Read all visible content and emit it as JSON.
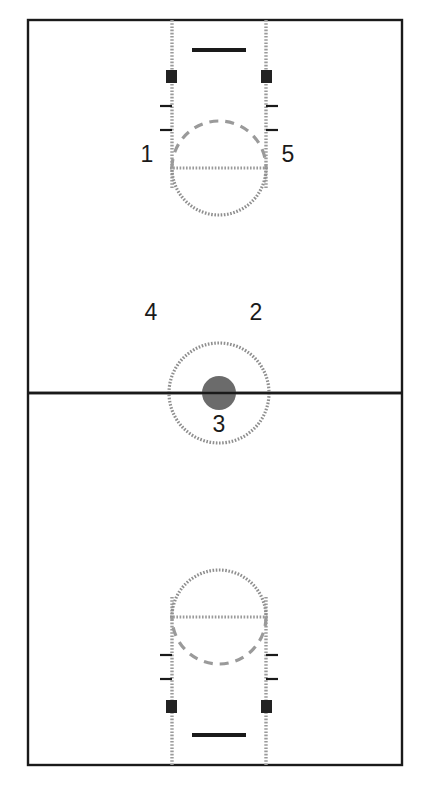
{
  "diagram": {
    "type": "basketball-court",
    "orientation": "vertical-full-court",
    "background_color": "#ffffff",
    "line_color_solid": "#1a1a1a",
    "line_color_dotted": "#9a9a9a",
    "marker_color": "#222222"
  },
  "court": {
    "boundary": {
      "x": 28,
      "y": 20,
      "width": 374,
      "height": 745
    },
    "half_court_line_y": 393,
    "center_circle": {
      "cx": 219,
      "cy": 393,
      "r": 50
    },
    "center_dot": {
      "cx": 219,
      "cy": 393,
      "r": 17
    }
  },
  "position_labels": [
    {
      "id": "1",
      "text": "1",
      "x": 147,
      "y": 162
    },
    {
      "id": "5",
      "text": "5",
      "x": 288,
      "y": 162
    },
    {
      "id": "4",
      "text": "4",
      "x": 151,
      "y": 320
    },
    {
      "id": "2",
      "text": "2",
      "x": 256,
      "y": 320
    },
    {
      "id": "3",
      "text": "3",
      "x": 219,
      "y": 432
    }
  ],
  "top_basket": {
    "lane": {
      "x": 172,
      "y": 20,
      "width": 94,
      "height": 168
    },
    "free_throw_line_y": 168,
    "free_throw_circle": {
      "cx": 219,
      "cy": 168,
      "r": 47
    },
    "backboard": {
      "x1": 192,
      "x2": 246,
      "y": 50
    },
    "lane_blocks": [
      {
        "x": 166,
        "y": 70,
        "width": 11,
        "height": 13
      },
      {
        "x": 261,
        "y": 70,
        "width": 11,
        "height": 13
      }
    ],
    "lane_ticks_y": [
      106,
      130
    ],
    "tick_length": 12
  },
  "bottom_basket": {
    "lane": {
      "x": 172,
      "y": 597,
      "width": 94,
      "height": 168
    },
    "free_throw_line_y": 617,
    "free_throw_circle": {
      "cx": 219,
      "cy": 617,
      "r": 47
    },
    "backboard": {
      "x1": 192,
      "x2": 246,
      "y": 735
    },
    "lane_blocks": [
      {
        "x": 166,
        "y": 700,
        "width": 11,
        "height": 13
      },
      {
        "x": 261,
        "y": 700,
        "width": 11,
        "height": 13
      }
    ],
    "lane_ticks_y": [
      655,
      679
    ],
    "tick_length": 12
  },
  "legend": {
    "title": "Basketball Court Positions",
    "note": "Numbered offensive positions 1 through 5"
  }
}
